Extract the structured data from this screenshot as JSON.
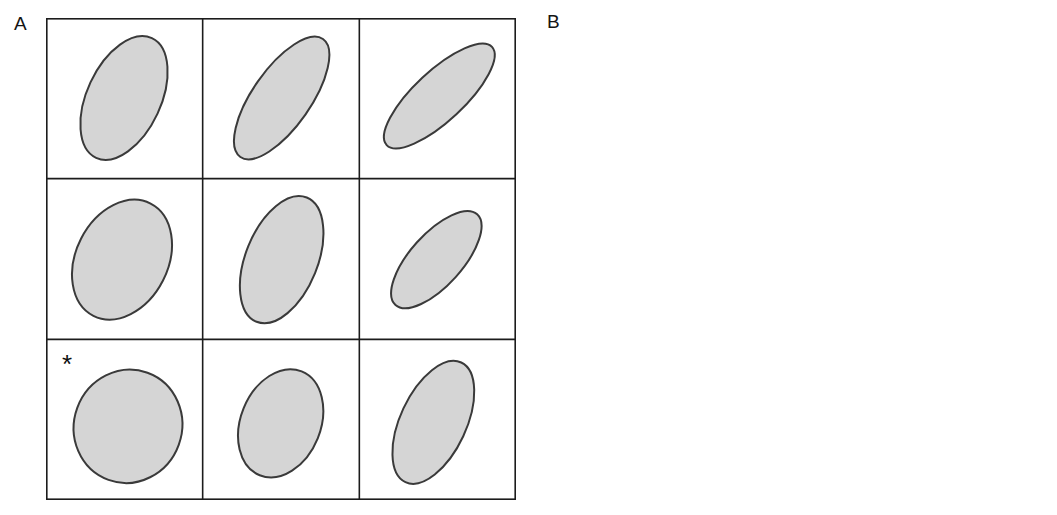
{
  "figure": {
    "background_color": "#ffffff",
    "width": 1057,
    "height": 515
  },
  "panels": [
    {
      "id": "A",
      "label": "A",
      "kind": "ellipse-grid",
      "marker": "*",
      "marker_cell": {
        "row": 2,
        "col": 0
      },
      "grid": {
        "rows": 3,
        "cols": 3,
        "x": 46,
        "y": 18,
        "width": 470,
        "height": 482,
        "cell_width": 156.7,
        "cell_height": 160.7,
        "line_color": "#1c1c1c",
        "line_width": 1.6
      },
      "style": {
        "fill_color": "#d5d5d5",
        "stroke_color": "#3a3a3a",
        "stroke_width": 2.0
      },
      "cells": [
        {
          "row": 0,
          "col": 0,
          "cx": 78,
          "cy": 80,
          "rx": 37,
          "ry": 66,
          "angle_deg": 25,
          "marked": false
        },
        {
          "row": 0,
          "col": 1,
          "cx": 79,
          "cy": 80,
          "rx": 29,
          "ry": 72,
          "angle_deg": 35,
          "marked": false
        },
        {
          "row": 0,
          "col": 2,
          "cx": 80,
          "cy": 78,
          "rx": 25,
          "ry": 72,
          "angle_deg": 47,
          "marked": false
        },
        {
          "row": 1,
          "col": 0,
          "cx": 76,
          "cy": 81,
          "rx": 46,
          "ry": 63,
          "angle_deg": 27,
          "marked": false
        },
        {
          "row": 1,
          "col": 1,
          "cx": 79,
          "cy": 81,
          "rx": 36,
          "ry": 67,
          "angle_deg": 22,
          "marked": false
        },
        {
          "row": 1,
          "col": 2,
          "cx": 77,
          "cy": 81,
          "rx": 26,
          "ry": 61,
          "angle_deg": 42,
          "marked": false
        },
        {
          "row": 2,
          "col": 0,
          "cx": 82,
          "cy": 87,
          "rx": 54,
          "ry": 57,
          "angle_deg": 20,
          "marked": true
        },
        {
          "row": 2,
          "col": 1,
          "cx": 78,
          "cy": 84,
          "rx": 40,
          "ry": 56,
          "angle_deg": 22,
          "marked": false
        },
        {
          "row": 2,
          "col": 2,
          "cx": 74,
          "cy": 83,
          "rx": 33,
          "ry": 66,
          "angle_deg": 25,
          "marked": false
        }
      ]
    },
    {
      "id": "B",
      "label": "B",
      "kind": "arrow-grid",
      "marker": "*",
      "marker_cell": {
        "row": 2,
        "col": 0
      },
      "grid": {
        "rows": 3,
        "cols": 3,
        "x": 577,
        "y": 16,
        "width": 461,
        "height": 482,
        "cell_width": 153.7,
        "cell_height": 160.7,
        "line_color": "#1c1c1c",
        "line_width": 1.6
      },
      "style": {
        "arrow_color": "#080808",
        "shaft_width": 5.0,
        "head_length": 26,
        "head_width": 23
      },
      "cells": [
        {
          "row": 0,
          "col": 0,
          "x1": 57,
          "y1": 131,
          "x2": 98,
          "y2": 36,
          "angle_from_vertical_deg": 23,
          "marked": false
        },
        {
          "row": 0,
          "col": 1,
          "x1": 48,
          "y1": 127,
          "x2": 110,
          "y2": 44,
          "angle_from_vertical_deg": 37,
          "marked": false
        },
        {
          "row": 0,
          "col": 2,
          "x1": 36,
          "y1": 122,
          "x2": 108,
          "y2": 41,
          "angle_from_vertical_deg": 42,
          "marked": false
        },
        {
          "row": 1,
          "col": 0,
          "x1": 56,
          "y1": 128,
          "x2": 99,
          "y2": 34,
          "angle_from_vertical_deg": 25,
          "marked": false
        },
        {
          "row": 1,
          "col": 1,
          "x1": 54,
          "y1": 128,
          "x2": 88,
          "y2": 35,
          "angle_from_vertical_deg": 20,
          "marked": false
        },
        {
          "row": 1,
          "col": 2,
          "x1": 52,
          "y1": 126,
          "x2": 98,
          "y2": 39,
          "angle_from_vertical_deg": 28,
          "marked": false
        },
        {
          "row": 2,
          "col": 0,
          "x1": 31,
          "y1": 63,
          "x2": 117,
          "y2": 95,
          "angle_from_vertical_deg": 110,
          "marked": true
        },
        {
          "row": 2,
          "col": 1,
          "x1": 59,
          "y1": 136,
          "x2": 90,
          "y2": 38,
          "angle_from_vertical_deg": 17,
          "marked": false
        },
        {
          "row": 2,
          "col": 2,
          "x1": 56,
          "y1": 138,
          "x2": 94,
          "y2": 38,
          "angle_from_vertical_deg": 21,
          "marked": false
        }
      ]
    }
  ],
  "marker_style": {
    "glyph": "*",
    "color": "#0d0d0d",
    "font_size": 26,
    "offset_x": 16,
    "offset_y": 8
  }
}
